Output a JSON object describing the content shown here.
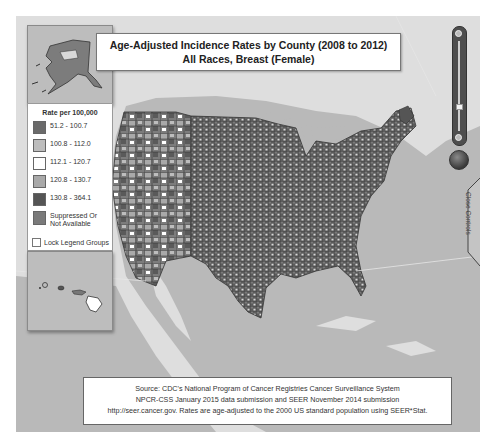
{
  "title": {
    "line1": "Age-Adjusted Incidence Rates by County (2008 to 2012)",
    "line2": "All Races, Breast (Female)"
  },
  "legend": {
    "title": "Rate per 100,000",
    "items": [
      {
        "label": "51.2 - 100.7",
        "color": "#6a6a6a"
      },
      {
        "label": "100.8 - 112.0",
        "color": "#bdbdbd"
      },
      {
        "label": "112.1 - 120.7",
        "color": "#ffffff"
      },
      {
        "label": "120.8 - 130.7",
        "color": "#a9a9a9"
      },
      {
        "label": "130.8 - 364.1",
        "color": "#555555"
      },
      {
        "label": "Suppressed Or",
        "label2": "Not Available",
        "color": "#7a7a7a"
      }
    ],
    "lock_label": "Lock Legend Groups",
    "lock_checked": false
  },
  "source": {
    "line1": "Source: CDC's National Program of Cancer Registries Cancer Surveillance System",
    "line2": "NPCR-CSS January 2015 data submission and SEER November 2014 submission",
    "line3": "http://seer.cancer.gov. Rates are age-adjusted to the 2000 US standard population using SEER*Stat."
  },
  "controls": {
    "close_controls_label": "Close Controls",
    "zoom_slider_position": 0.7
  },
  "insets": {
    "alaska": "Alaska inset",
    "hawaii": "Hawaii inset"
  },
  "colors": {
    "ocean": "#b9b9b9",
    "land": "#dedede",
    "county_border": "#3a3a3a"
  }
}
